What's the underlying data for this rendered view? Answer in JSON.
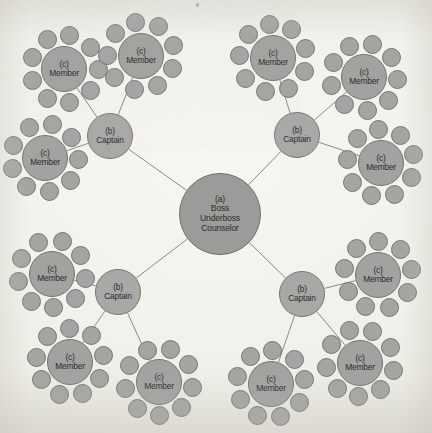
{
  "diagram": {
    "background_color": "#f1f0ea",
    "node_fill_color": "#a2a2a0",
    "node_stroke_color": "#737371",
    "edge_color": "#8a8a88",
    "text_color": "#2c2c2c",
    "canvas": {
      "width": 432,
      "height": 433
    }
  },
  "labels": {
    "boss_tag": "(a)",
    "boss_line1": "Boss",
    "boss_line2": "Underboss",
    "boss_line3": "Counselor",
    "captain_tag": "(b)",
    "captain_title": "Captain",
    "member_tag": "(c)",
    "member_title": "Member"
  },
  "structure": {
    "boss_count": 1,
    "captain_count": 4,
    "member_cluster_count": 12,
    "members_per_captain": 3,
    "satellites_per_member": 9
  },
  "nodes": {
    "boss": {
      "id": "boss",
      "cx": 220,
      "cy": 214,
      "r": 41
    },
    "captains": [
      {
        "id": "captain-top-left",
        "cx": 110,
        "cy": 136,
        "r": 23
      },
      {
        "id": "captain-top-right",
        "cx": 297,
        "cy": 135,
        "r": 23
      },
      {
        "id": "captain-bottom-left",
        "cx": 118,
        "cy": 292,
        "r": 23
      },
      {
        "id": "captain-bottom-right",
        "cx": 302,
        "cy": 294,
        "r": 23
      }
    ],
    "members": [
      {
        "id": "member-tl-a",
        "cx": 64,
        "cy": 69,
        "r": 23,
        "captain": "captain-top-left"
      },
      {
        "id": "member-tl-b",
        "cx": 141,
        "cy": 56,
        "r": 23,
        "captain": "captain-top-left"
      },
      {
        "id": "member-tl-c",
        "cx": 45,
        "cy": 158,
        "r": 23,
        "captain": "captain-top-left"
      },
      {
        "id": "member-tr-a",
        "cx": 273,
        "cy": 58,
        "r": 23,
        "captain": "captain-top-right"
      },
      {
        "id": "member-tr-b",
        "cx": 364,
        "cy": 77,
        "r": 23,
        "captain": "captain-top-right"
      },
      {
        "id": "member-tr-c",
        "cx": 381,
        "cy": 163,
        "r": 23,
        "captain": "captain-top-right"
      },
      {
        "id": "member-bl-a",
        "cx": 52,
        "cy": 274,
        "r": 23,
        "captain": "captain-bottom-left"
      },
      {
        "id": "member-bl-b",
        "cx": 70,
        "cy": 362,
        "r": 23,
        "captain": "captain-bottom-left"
      },
      {
        "id": "member-bl-c",
        "cx": 159,
        "cy": 382,
        "r": 23,
        "captain": "captain-bottom-left"
      },
      {
        "id": "member-br-a",
        "cx": 378,
        "cy": 275,
        "r": 23,
        "captain": "captain-bottom-right"
      },
      {
        "id": "member-br-b",
        "cx": 360,
        "cy": 363,
        "r": 23,
        "captain": "captain-bottom-right"
      },
      {
        "id": "member-br-c",
        "cx": 271,
        "cy": 384,
        "r": 23,
        "captain": "captain-bottom-right"
      }
    ]
  },
  "satellite": {
    "radius": 9.5
  }
}
